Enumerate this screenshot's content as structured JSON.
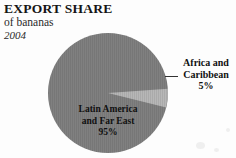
{
  "header": {
    "title": "EXPORT SHARE",
    "subtitle": "of bananas",
    "year": "2004"
  },
  "colors": {
    "background": "#fdfdfd",
    "major_slice": "#808080",
    "minor_slice": "#b7b7b7",
    "text": "#101010",
    "leader_line": "#333333"
  },
  "labels": {
    "latin": {
      "line1": "Latin America",
      "line2": "and Far East",
      "percent": "95%"
    },
    "africa": {
      "line1": "Africa and",
      "line2": "Caribbean",
      "percent": "5%"
    }
  },
  "chart_data": {
    "type": "pie",
    "title": "EXPORT SHARE",
    "subtitle": "of bananas",
    "year": "2004",
    "unit": "percent",
    "legend_position": "callout-labels",
    "grid": false,
    "categories": [
      "Latin America and Far East",
      "Africa and Caribbean"
    ],
    "values": [
      95,
      5
    ],
    "slices": [
      {
        "label": "Latin America and Far East",
        "value": 95,
        "display_value": "95%",
        "color": "#808080",
        "start_angle_deg": 5,
        "end_angle_deg": 347
      },
      {
        "label": "Africa and Caribbean",
        "value": 5,
        "display_value": "5%",
        "color": "#b7b7b7",
        "start_angle_deg": 347,
        "end_angle_deg": 5
      }
    ],
    "total": 100,
    "xlabel": "",
    "ylabel": ""
  }
}
